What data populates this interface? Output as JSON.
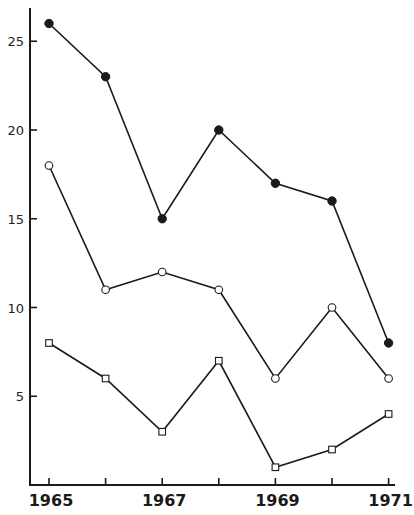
{
  "chart_data": {
    "type": "line",
    "title": "",
    "xlabel": "",
    "ylabel": "",
    "x": [
      1965,
      1966,
      1967,
      1968,
      1969,
      1970,
      1971
    ],
    "x_tick_labels": [
      "1965",
      "1967",
      "1969",
      "1971"
    ],
    "y_tick_labels": [
      "5",
      "10",
      "15",
      "20",
      "25"
    ],
    "y_ticks": [
      5,
      10,
      15,
      20,
      25
    ],
    "ylim": [
      0,
      27
    ],
    "xlim": [
      1964.67,
      1971.2
    ],
    "grid": false,
    "legend": null,
    "series": [
      {
        "name": "filled-circle series",
        "marker": "filled-circle",
        "values": [
          26,
          23,
          15,
          20,
          17,
          16,
          8
        ]
      },
      {
        "name": "open-circle series",
        "marker": "open-circle",
        "values": [
          18,
          11,
          12,
          11,
          6,
          10,
          6
        ]
      },
      {
        "name": "open-square series",
        "marker": "open-square",
        "values": [
          8,
          6,
          3,
          7,
          1,
          2,
          4
        ]
      }
    ]
  },
  "colors": {
    "ink": "#1a1a1a",
    "background": "#ffffff"
  }
}
